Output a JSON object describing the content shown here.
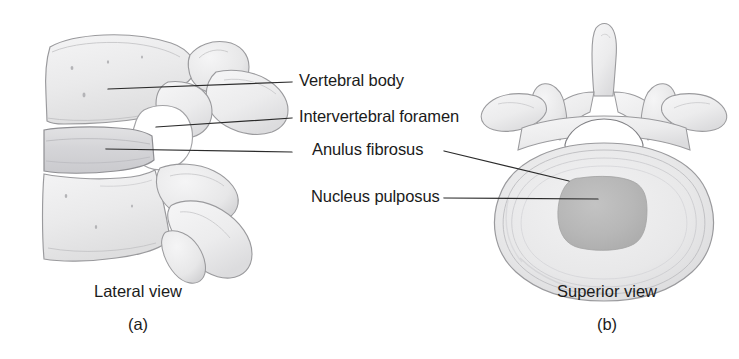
{
  "figure": {
    "background_color": "#ffffff",
    "line_color": "#2b2b2b",
    "bone_fill": "#ececed",
    "bone_stroke": "#9a9a9d",
    "disc_fill": "#d9d9db",
    "nucleus_fill": "#b6b6b6",
    "anulus_fill": "#e6e6e7"
  },
  "labels": {
    "vertebral_body": "Vertebral body",
    "intervertebral_foramen": "Intervertebral foramen",
    "anulus_fibrosus": "Anulus fibrosus",
    "nucleus_pulposus": "Nucleus pulposus"
  },
  "panels": {
    "left": {
      "caption": "Lateral view",
      "letter": "(a)",
      "parts": [
        "vertebral-body-upper",
        "vertebral-body-lower",
        "intervertebral-disc",
        "intervertebral-foramen",
        "superior-articular-process",
        "spinous-process-upper",
        "spinous-process-lower",
        "inferior-articular-process"
      ]
    },
    "right": {
      "caption": "Superior view",
      "letter": "(b)",
      "parts": [
        "spinous-process",
        "transverse-process-left",
        "transverse-process-right",
        "superior-articular-process-left",
        "superior-articular-process-right",
        "vertebral-foramen",
        "anulus-fibrosus",
        "nucleus-pulposus"
      ]
    }
  },
  "leader_lines": [
    {
      "name": "vertebral-body",
      "x1": 108,
      "y1": 89,
      "x2": 292,
      "y2": 82
    },
    {
      "name": "intervertebral-foramen",
      "x1": 156,
      "y1": 127,
      "x2": 292,
      "y2": 118
    },
    {
      "name": "anulus-fibrosus-left",
      "x1": 106,
      "y1": 149,
      "x2": 292,
      "y2": 152
    },
    {
      "name": "anulus-fibrosus-right",
      "x1": 444,
      "y1": 151,
      "x2": 569,
      "y2": 181
    },
    {
      "name": "nucleus-pulposus",
      "x1": 444,
      "y1": 198,
      "x2": 598,
      "y2": 199
    }
  ]
}
